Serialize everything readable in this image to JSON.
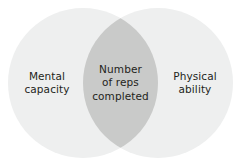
{
  "diagram": {
    "type": "venn",
    "canvas": {
      "width": 242,
      "height": 165,
      "background": "#ffffff"
    },
    "colors": {
      "circle_fill": "#eeefef",
      "overlap_fill": "#c9cac9",
      "text": "#231f20"
    },
    "sets": [
      {
        "id": "left",
        "label": "Mental\ncapacity",
        "label_plain": "Mental capacity",
        "center_x": 83,
        "center_y": 83,
        "radius": 75,
        "fill": "#eeefef"
      },
      {
        "id": "right",
        "label": "Physical\nability",
        "label_plain": "Physical ability",
        "center_x": 158,
        "center_y": 83,
        "radius": 75,
        "fill": "#eeefef"
      }
    ],
    "intersection": {
      "id": "overlap",
      "label": "Number\nof reps\ncompleted",
      "label_plain": "Number of reps completed",
      "fill": "#c9cac9"
    }
  }
}
